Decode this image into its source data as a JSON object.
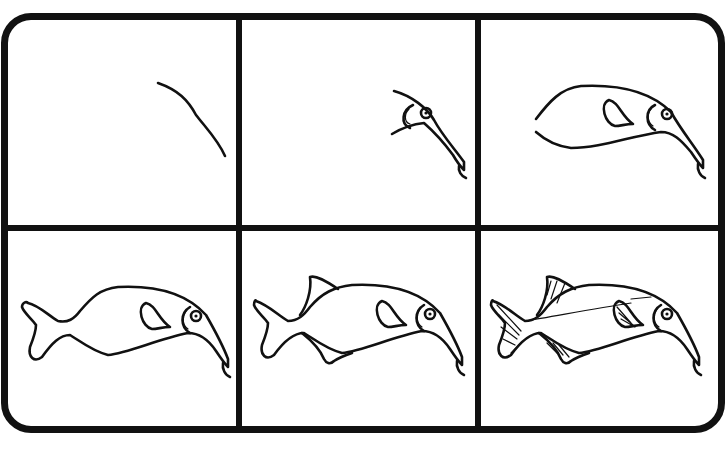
{
  "guide": {
    "subject": "fish drawing tutorial",
    "layout": "2x3 grid",
    "colors": {
      "line": "#111111",
      "background": "#ffffff"
    },
    "panels": [
      {
        "step": 1,
        "content": "curved back line"
      },
      {
        "step": 2,
        "content": "head with eye and long snout"
      },
      {
        "step": 3,
        "content": "body outline with pectoral fin"
      },
      {
        "step": 4,
        "content": "tail fin added"
      },
      {
        "step": 5,
        "content": "dorsal and anal fins added"
      },
      {
        "step": 6,
        "content": "fin rays and lateral line details"
      }
    ]
  }
}
